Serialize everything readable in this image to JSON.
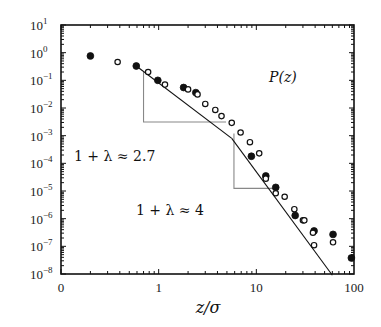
{
  "chart_data": {
    "type": "scatter",
    "title": "",
    "xlabel": "z/σ",
    "ylabel": "",
    "xscale": "log",
    "yscale": "log",
    "xlim": [
      0.1,
      100
    ],
    "ylim": [
      1e-08,
      10
    ],
    "x_tick_labels": [
      "0",
      "1",
      "10",
      "100"
    ],
    "x_tick_values": [
      0.1,
      1,
      10,
      100
    ],
    "y_tick_labels": [
      "10^1",
      "10^0",
      "10^-1",
      "10^-2",
      "10^-3",
      "10^-4",
      "10^-5",
      "10^-6",
      "10^-7",
      "10^-8"
    ],
    "y_tick_values": [
      10,
      1,
      0.1,
      0.01,
      0.001,
      0.0001,
      1e-05,
      1e-06,
      1e-07,
      1e-08
    ],
    "grid": false,
    "legend": null,
    "curve_label": "P(z)",
    "series": [
      {
        "name": "filled",
        "marker": "filled-circle",
        "points": [
          {
            "x": 0.2,
            "y": 0.76
          },
          {
            "x": 0.59,
            "y": 0.33
          },
          {
            "x": 0.98,
            "y": 0.1
          },
          {
            "x": 1.8,
            "y": 0.055
          },
          {
            "x": 2.4,
            "y": 0.036
          },
          {
            "x": 8.9,
            "y": 0.00018
          },
          {
            "x": 12.5,
            "y": 3.5e-05
          },
          {
            "x": 15.8,
            "y": 1.35e-05
          },
          {
            "x": 25,
            "y": 1.3e-06
          },
          {
            "x": 39,
            "y": 3.6e-07
          },
          {
            "x": 61,
            "y": 2.7e-07
          },
          {
            "x": 94,
            "y": 3.8e-08
          }
        ]
      },
      {
        "name": "open",
        "marker": "open-circle",
        "points": [
          {
            "x": 0.38,
            "y": 0.46
          },
          {
            "x": 0.78,
            "y": 0.2
          },
          {
            "x": 1.16,
            "y": 0.07
          },
          {
            "x": 2.0,
            "y": 0.047
          },
          {
            "x": 2.5,
            "y": 0.031
          },
          {
            "x": 3.0,
            "y": 0.014
          },
          {
            "x": 3.8,
            "y": 0.0085
          },
          {
            "x": 4.4,
            "y": 0.0051
          },
          {
            "x": 5.6,
            "y": 0.0029
          },
          {
            "x": 6.9,
            "y": 0.0013
          },
          {
            "x": 8.6,
            "y": 0.00058
          },
          {
            "x": 10.7,
            "y": 0.00023
          },
          {
            "x": 12.5,
            "y": 2.8e-05
          },
          {
            "x": 15.8,
            "y": 8.3e-06
          },
          {
            "x": 19.5,
            "y": 6.2e-06
          },
          {
            "x": 24.5,
            "y": 2.2e-06
          },
          {
            "x": 30,
            "y": 8.7e-07
          },
          {
            "x": 31,
            "y": 8.7e-07
          },
          {
            "x": 38,
            "y": 3.1e-07
          },
          {
            "x": 39,
            "y": 1.1e-07
          },
          {
            "x": 61,
            "y": 1.4e-07
          }
        ]
      }
    ],
    "fit_line": {
      "segments": [
        {
          "x_start": 0.59,
          "y_start": 0.33,
          "x_end": 5.6,
          "y_end": 0.0008,
          "slope_label": "1 + λ ≈ 2.7"
        },
        {
          "x_start": 5.6,
          "y_start": 0.0008,
          "x_end": 60,
          "y_end": 9e-09,
          "slope_label": "1 + λ ≈ 4"
        }
      ]
    },
    "annotations": [
      {
        "text": "P(z)",
        "x": 26,
        "y": 0.12
      },
      {
        "text": "1 + λ ≈ 2.7",
        "x": 0.12,
        "y": 0.0008
      },
      {
        "text": "1 + λ ≈ 4",
        "x": 0.75,
        "y": 1.2e-06
      }
    ],
    "slope_triangles": [
      {
        "x_vertical": 0.7,
        "y_top": 0.2,
        "y_bottom": 0.0031,
        "x_right": 4.9
      },
      {
        "x_vertical": 5.9,
        "y_top": 0.0012,
        "y_bottom": 1.24e-05,
        "x_right": 16.4
      }
    ]
  },
  "labels": {
    "x_axis_title": "z/σ",
    "curve_label": "P(z)",
    "slope1": "1 + λ ≈ 2.7",
    "slope2": "1 + λ ≈ 4"
  }
}
